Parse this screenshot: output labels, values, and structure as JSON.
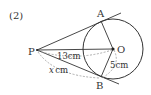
{
  "problem_number": "(2)",
  "points": {
    "P": "P",
    "O": "O",
    "A": "A",
    "B": "B"
  },
  "measurements": {
    "PO": "13cm",
    "PB": "x cm",
    "PB_var": "x",
    "PB_unit": "cm",
    "OB": "5cm"
  },
  "colors": {
    "line": "#333333",
    "dashed": "#999999",
    "background": "#ffffff"
  }
}
